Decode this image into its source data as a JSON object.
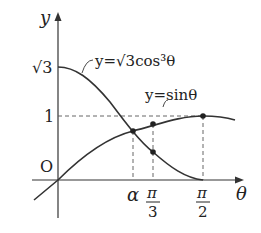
{
  "diagram": {
    "axes": {
      "x_label": "θ",
      "y_label": "y",
      "origin_label": "O"
    },
    "y_ticks": [
      {
        "label": "√3",
        "value": 1.732
      },
      {
        "label": "1",
        "value": 1
      }
    ],
    "x_ticks": [
      {
        "label": "α",
        "kind": "symbol"
      },
      {
        "label_num": "π",
        "label_den": "3",
        "kind": "fraction"
      },
      {
        "label_num": "π",
        "label_den": "2",
        "kind": "fraction"
      }
    ],
    "curves": [
      {
        "name": "cos-curve",
        "label": "y=√3cos³θ"
      },
      {
        "name": "sin-curve",
        "label": "y=sinθ"
      }
    ],
    "colors": {
      "curve": "#333333",
      "axis": "#333333",
      "guide": "#555555"
    }
  }
}
